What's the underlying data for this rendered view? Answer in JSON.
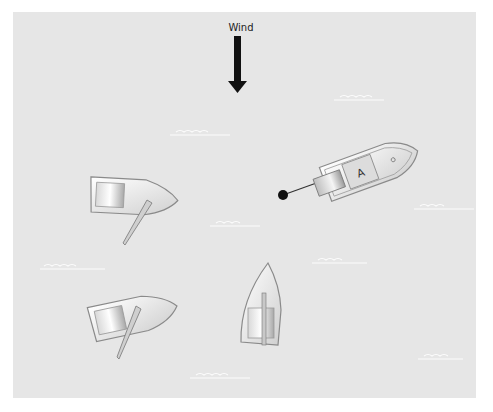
{
  "diagram": {
    "wind": {
      "label": "Wind",
      "direction": "down"
    },
    "boats": [
      {
        "id": "boat-A",
        "type": "motor-boat",
        "label": "A",
        "heading": "right-up",
        "has_anchor_line": true
      },
      {
        "id": "boat-upper-left",
        "type": "rowboat-with-oar",
        "heading": "right"
      },
      {
        "id": "boat-lower-left",
        "type": "rowboat-with-oar",
        "heading": "right-up"
      },
      {
        "id": "boat-center",
        "type": "rowboat",
        "heading": "up"
      }
    ],
    "colors": {
      "water": "#e6e6e6",
      "arrow": "#111111",
      "hull": "#f2f2f2",
      "outline": "#8a8a8a"
    }
  }
}
